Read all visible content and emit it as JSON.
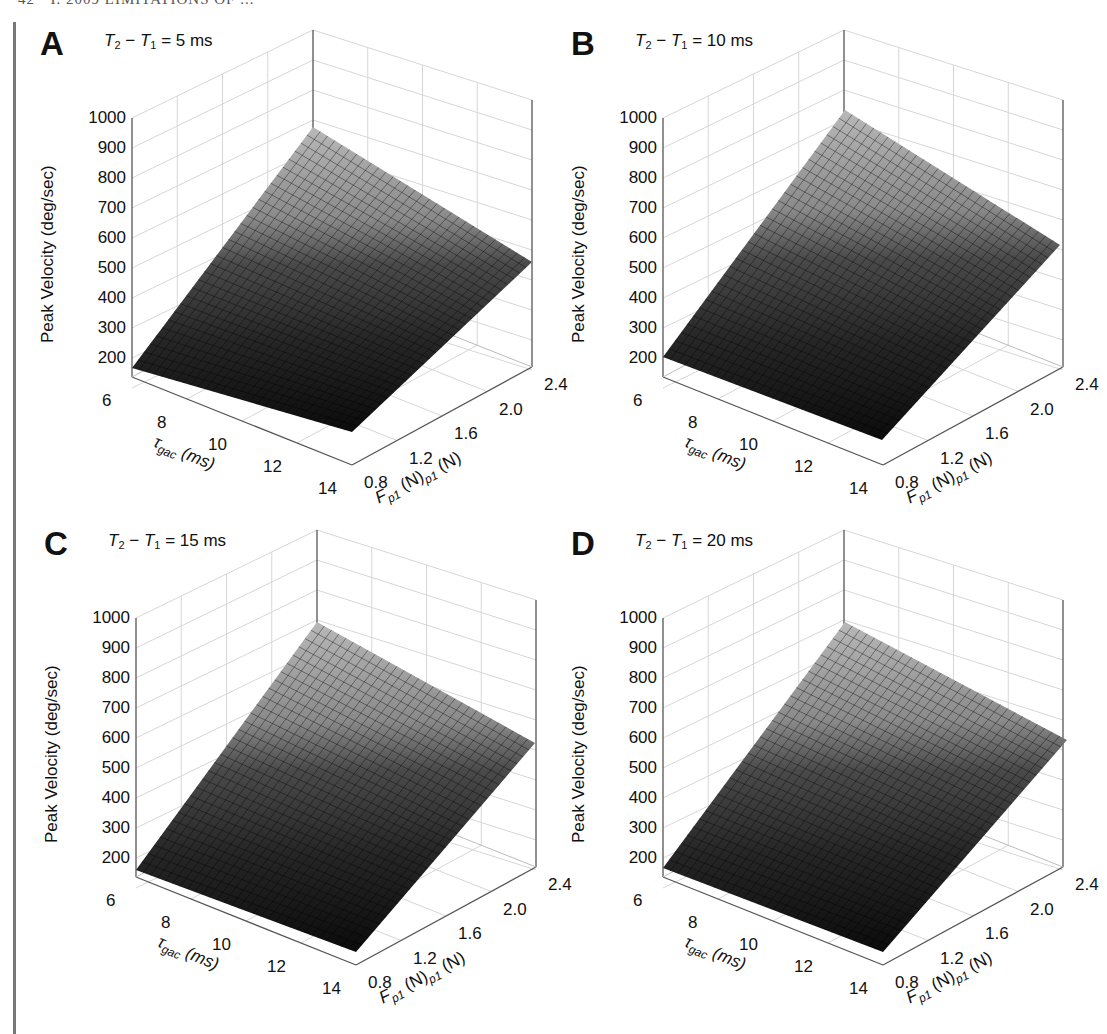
{
  "page": {
    "running_header": "42 · I. 2009 LIMITATIONS OF ..."
  },
  "shared_axes": {
    "z_label": "Peak Velocity (deg/sec)",
    "z_ticks": [
      "1000",
      "900",
      "800",
      "700",
      "600",
      "500",
      "400",
      "300",
      "200"
    ],
    "x_label_main": "τ",
    "x_label_sub": "gac",
    "x_label_unit": " (ms)",
    "x_ticks": [
      "6",
      "8",
      "10",
      "12",
      "14"
    ],
    "y_label_main": "F",
    "y_label_sub": "p1",
    "y_label_unit": " (N)",
    "y_label_sub2": "p1",
    "y_label_unit2": " (N)",
    "y_ticks": [
      "0.8",
      "1.2",
      "1.6",
      "2.0",
      "2.4"
    ]
  },
  "panels": [
    {
      "letter": "A",
      "cond_left": "T",
      "cond_sub1": "2",
      "cond_mid": " − ",
      "cond_T1": "T",
      "cond_sub2": "1",
      "cond_value": " =  5 ms",
      "offset": [
        0,
        0
      ],
      "surface_px": {
        "left": [
          132,
          368
        ],
        "back": [
          313,
          127
        ],
        "right": [
          532,
          262
        ],
        "front": [
          352,
          432
        ]
      }
    },
    {
      "letter": "B",
      "cond_left": "T",
      "cond_sub1": "2",
      "cond_mid": " − ",
      "cond_T1": "T",
      "cond_sub2": "1",
      "cond_value": " =  10 ms",
      "offset": [
        531,
        0
      ],
      "surface_px": {
        "left": [
          663,
          357
        ],
        "back": [
          845,
          110
        ],
        "right": [
          1060,
          245
        ],
        "front": [
          882,
          440
        ]
      }
    },
    {
      "letter": "C",
      "cond_left": "T",
      "cond_sub1": "2",
      "cond_mid": " − ",
      "cond_T1": "T",
      "cond_sub2": "1",
      "cond_value": " =  15 ms",
      "offset": [
        4,
        500
      ],
      "surface_px": {
        "left": [
          136,
          870
        ],
        "back": [
          317,
          622
        ],
        "right": [
          535,
          743
        ],
        "front": [
          356,
          952
        ]
      }
    },
    {
      "letter": "D",
      "cond_left": "T",
      "cond_sub1": "2",
      "cond_mid": " − ",
      "cond_T1": "T",
      "cond_sub2": "1",
      "cond_value": " =  20 ms",
      "offset": [
        531,
        500
      ],
      "surface_px": {
        "left": [
          663,
          868
        ],
        "back": [
          845,
          622
        ],
        "right": [
          1067,
          740
        ],
        "front": [
          883,
          952
        ]
      }
    }
  ],
  "chart_data": [
    {
      "type": "surface3d",
      "title": "A  T2 − T1 = 5 ms",
      "xlabel": "τgac (ms)",
      "ylabel": "Fp1 (N)",
      "zlabel": "Peak Velocity (deg/sec)",
      "x": [
        6,
        8,
        10,
        12,
        14
      ],
      "y": [
        0.8,
        1.2,
        1.6,
        2.0,
        2.4
      ],
      "zlim": [
        150,
        1000
      ],
      "corners": {
        "tau6_F0.8": 200,
        "tau6_F2.4": 880,
        "tau14_F2.4": 500,
        "tau14_F0.8": 130
      },
      "grid": true,
      "colormap": "gray"
    },
    {
      "type": "surface3d",
      "title": "B  T2 − T1 = 10 ms",
      "xlabel": "τgac (ms)",
      "ylabel": "Fp1 (N)",
      "zlabel": "Peak Velocity (deg/sec)",
      "x": [
        6,
        8,
        10,
        12,
        14
      ],
      "y": [
        0.8,
        1.2,
        1.6,
        2.0,
        2.4
      ],
      "zlim": [
        150,
        1000
      ],
      "corners": {
        "tau6_F0.8": 200,
        "tau6_F2.4": 950,
        "tau14_F2.4": 560,
        "tau14_F0.8": 130
      },
      "grid": true,
      "colormap": "gray"
    },
    {
      "type": "surface3d",
      "title": "C  T2 − T1 = 15 ms",
      "xlabel": "τgac (ms)",
      "ylabel": "Fp1 (N)",
      "zlabel": "Peak Velocity (deg/sec)",
      "x": [
        6,
        8,
        10,
        12,
        14
      ],
      "y": [
        0.8,
        1.2,
        1.6,
        2.0,
        2.4
      ],
      "zlim": [
        150,
        1000
      ],
      "corners": {
        "tau6_F0.8": 200,
        "tau6_F2.4": 960,
        "tau14_F2.4": 590,
        "tau14_F0.8": 130
      },
      "grid": true,
      "colormap": "gray"
    },
    {
      "type": "surface3d",
      "title": "D  T2 − T1 = 20 ms",
      "xlabel": "τgac (ms)",
      "ylabel": "Fp1 (N)",
      "zlabel": "Peak Velocity (deg/sec)",
      "x": [
        6,
        8,
        10,
        12,
        14
      ],
      "y": [
        0.8,
        1.2,
        1.6,
        2.0,
        2.4
      ],
      "zlim": [
        150,
        1000
      ],
      "corners": {
        "tau6_F0.8": 200,
        "tau6_F2.4": 960,
        "tau14_F2.4": 600,
        "tau14_F0.8": 130
      },
      "grid": true,
      "colormap": "gray"
    }
  ]
}
